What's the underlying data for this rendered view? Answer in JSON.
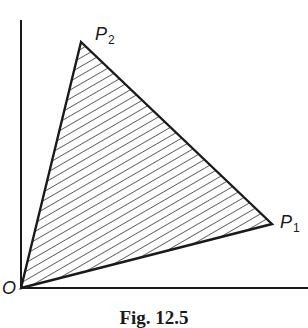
{
  "figure": {
    "caption": "Fig. 12.5",
    "colors": {
      "stroke": "#1a1a1a",
      "hatch": "#2a2a2a",
      "background": "#ffffff"
    },
    "axes": {
      "origin": {
        "x": 21,
        "y": 288
      },
      "y_axis_top": {
        "x": 21,
        "y": 20
      },
      "x_axis_right": {
        "x": 308,
        "y": 288
      }
    },
    "triangle": {
      "vertices": [
        {
          "name": "O",
          "x": 21,
          "y": 288
        },
        {
          "name": "P1",
          "x": 272,
          "y": 224
        },
        {
          "name": "P2",
          "x": 81,
          "y": 42
        }
      ],
      "fill": "diagonal-hatch"
    },
    "labels": {
      "origin": {
        "text": "O"
      },
      "p1": {
        "base": "P",
        "sub": "1"
      },
      "p2": {
        "base": "P",
        "sub": "2"
      }
    }
  }
}
